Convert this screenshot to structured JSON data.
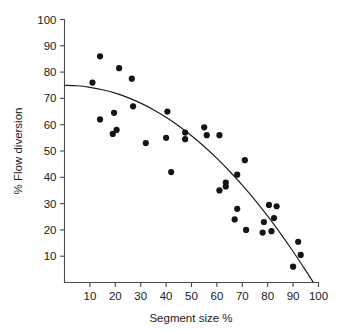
{
  "chart_data": {
    "type": "scatter",
    "title": "",
    "xlabel": "Segment size %",
    "ylabel": "% Flow diversion",
    "xlim": [
      0,
      100
    ],
    "ylim": [
      0,
      100
    ],
    "xticks": [
      10,
      20,
      30,
      40,
      50,
      60,
      70,
      80,
      90,
      100
    ],
    "yticks": [
      10,
      20,
      30,
      40,
      50,
      60,
      70,
      80,
      90,
      100
    ],
    "grid": false,
    "legend": null,
    "series": [
      {
        "name": "observations",
        "marker": "filled-circle",
        "color": "#141414",
        "points": [
          [
            11,
            76
          ],
          [
            14,
            86
          ],
          [
            14,
            62
          ],
          [
            19,
            56.5
          ],
          [
            19.5,
            64.5
          ],
          [
            20.5,
            58
          ],
          [
            21.5,
            81.5
          ],
          [
            26.5,
            77.5
          ],
          [
            27,
            67
          ],
          [
            32,
            53
          ],
          [
            40,
            55
          ],
          [
            40.5,
            65
          ],
          [
            42,
            42
          ],
          [
            47.5,
            57
          ],
          [
            47.5,
            54.5
          ],
          [
            55,
            59
          ],
          [
            56,
            56
          ],
          [
            61,
            56
          ],
          [
            61,
            35
          ],
          [
            63.5,
            38
          ],
          [
            63.5,
            36.5
          ],
          [
            67,
            24
          ],
          [
            68,
            41
          ],
          [
            68,
            28
          ],
          [
            71,
            46.5
          ],
          [
            71.5,
            20
          ],
          [
            78,
            19
          ],
          [
            78.5,
            23
          ],
          [
            80.5,
            29.5
          ],
          [
            81.5,
            19.5
          ],
          [
            82.5,
            24.5
          ],
          [
            83.5,
            29
          ],
          [
            90,
            6
          ],
          [
            92,
            15.5
          ],
          [
            93,
            10.5
          ]
        ]
      }
    ],
    "fit_curve": {
      "name": "fitted-trend",
      "color": "#1b1b1b",
      "points": [
        [
          0,
          75
        ],
        [
          5,
          74.8
        ],
        [
          10,
          74.2
        ],
        [
          15,
          73.3
        ],
        [
          20,
          72.0
        ],
        [
          25,
          70.3
        ],
        [
          30,
          68.2
        ],
        [
          35,
          65.7
        ],
        [
          40,
          62.8
        ],
        [
          45,
          59.5
        ],
        [
          50,
          55.8
        ],
        [
          55,
          51.7
        ],
        [
          60,
          47.2
        ],
        [
          65,
          42.3
        ],
        [
          70,
          37.0
        ],
        [
          75,
          31.3
        ],
        [
          80,
          25.2
        ],
        [
          85,
          18.7
        ],
        [
          90,
          11.8
        ],
        [
          95,
          4.5
        ],
        [
          98,
          0
        ]
      ]
    }
  }
}
